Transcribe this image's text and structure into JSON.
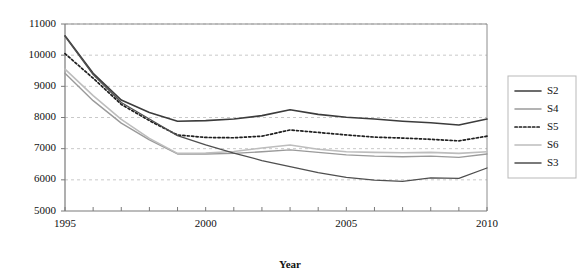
{
  "chart_data": {
    "type": "line",
    "title": "",
    "subtitle": "",
    "xlabel": "Year",
    "ylabel": "",
    "xlim": [
      1995,
      2010
    ],
    "ylim": [
      5000,
      11000
    ],
    "grid": true,
    "legend_position": "right",
    "x": [
      1995,
      1996,
      1997,
      1998,
      1999,
      2000,
      2001,
      2002,
      2003,
      2004,
      2005,
      2006,
      2007,
      2008,
      2009,
      2010
    ],
    "xtick_labels": [
      "1995",
      "2000",
      "2005",
      "2010"
    ],
    "xtick_values": [
      1995,
      2000,
      2005,
      2010
    ],
    "ytick_labels": [
      "5000",
      "6000",
      "7000",
      "8000",
      "9000",
      "10000",
      "11000"
    ],
    "ytick_values": [
      5000,
      6000,
      7000,
      8000,
      9000,
      10000,
      11000
    ],
    "series": [
      {
        "name": "S2",
        "color": "#3c3c3c",
        "style": "solid",
        "width": 1.6,
        "values": [
          10620,
          9420,
          8560,
          8160,
          7880,
          7900,
          7950,
          8060,
          8250,
          8100,
          8010,
          7950,
          7880,
          7830,
          7760,
          7950
        ]
      },
      {
        "name": "S4",
        "color": "#9a9a9a",
        "style": "solid",
        "width": 1.4,
        "values": [
          9420,
          8540,
          7820,
          7280,
          6830,
          6830,
          6850,
          6900,
          6960,
          6880,
          6800,
          6760,
          6740,
          6760,
          6720,
          6830
        ]
      },
      {
        "name": "S5",
        "color": "#1f1f1f",
        "style": "dotted",
        "width": 1.7,
        "values": [
          10050,
          9260,
          8420,
          7900,
          7440,
          7360,
          7350,
          7400,
          7600,
          7520,
          7440,
          7370,
          7340,
          7300,
          7250,
          7400
        ]
      },
      {
        "name": "S6",
        "color": "#bdbdbd",
        "style": "solid",
        "width": 1.6,
        "values": [
          9550,
          8700,
          7940,
          7330,
          6850,
          6860,
          6910,
          7020,
          7120,
          6980,
          6900,
          6880,
          6870,
          6880,
          6850,
          6900
        ]
      },
      {
        "name": "S3",
        "color": "#4f4f4f",
        "style": "solid",
        "width": 1.3,
        "values": [
          10600,
          9380,
          8480,
          7950,
          7420,
          7120,
          6860,
          6620,
          6420,
          6230,
          6080,
          5990,
          5950,
          6060,
          6050,
          6380
        ]
      }
    ]
  },
  "legend": {
    "items": [
      {
        "label": "S2"
      },
      {
        "label": "S4"
      },
      {
        "label": "S5"
      },
      {
        "label": "S6"
      },
      {
        "label": "S3"
      }
    ]
  },
  "axes": {
    "x_title": "Year"
  }
}
